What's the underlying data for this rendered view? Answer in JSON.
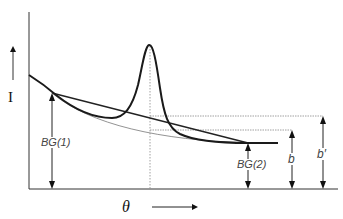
{
  "diagram": {
    "y_axis_label": "I",
    "x_axis_label": "θ",
    "labels": {
      "bg1": "BG(1)",
      "bg2": "BG(2)",
      "b": "b",
      "b_prime": "b′"
    },
    "colors": {
      "curve": "#1a1a1a",
      "axis": "#333333",
      "guide": "#888888",
      "text": "#444444"
    }
  }
}
